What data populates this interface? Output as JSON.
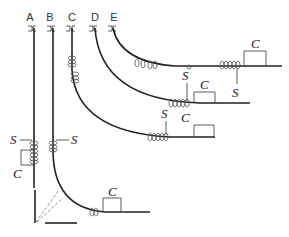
{
  "diagram": {
    "labels": {
      "paths": [
        "A",
        "B",
        "C",
        "D",
        "E"
      ]
    },
    "symbols": {
      "s": "S",
      "c": "C"
    },
    "colors": {
      "stroke": "#222222",
      "background": "#ffffff",
      "coil": "#555555"
    }
  }
}
